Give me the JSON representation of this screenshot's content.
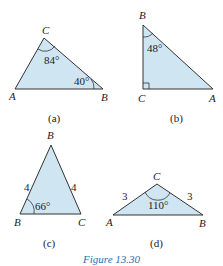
{
  "figure": {
    "caption": "Figure 13.30",
    "caption_color": "#2a6fb5",
    "fill_color": "#cfe5f2",
    "triangles": {
      "a": {
        "label": "(a)",
        "vertices": {
          "A": "A",
          "B": "B",
          "C": "C"
        },
        "angles": {
          "C": "84°",
          "B": "40°"
        }
      },
      "b": {
        "label": "(b)",
        "vertices": {
          "B": "B",
          "C": "C",
          "A": "A"
        },
        "angles": {
          "B": "48°",
          "C": "right-angle"
        }
      },
      "c": {
        "label": "(c)",
        "vertices": {
          "top": "B",
          "left": "B",
          "right": "C"
        },
        "sides": {
          "left": "4",
          "right": "4"
        },
        "angles": {
          "left": "66°"
        }
      },
      "d": {
        "label": "(d)",
        "vertices": {
          "A": "A",
          "C": "C",
          "B": "B"
        },
        "sides": {
          "AC": "3",
          "CB": "3"
        },
        "angles": {
          "C": "110°"
        }
      }
    }
  }
}
